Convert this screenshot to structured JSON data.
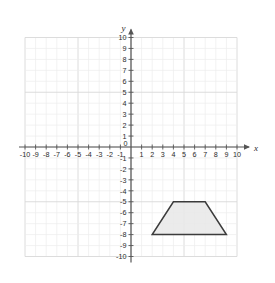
{
  "chart_data": {
    "type": "scatter",
    "title": "",
    "xlabel": "x",
    "ylabel": "y",
    "xlim": [
      -10,
      10
    ],
    "ylim": [
      -10,
      10
    ],
    "grid": true,
    "legend": false,
    "x_ticks": [
      "-10",
      "-9",
      "-8",
      "-7",
      "-6",
      "-5",
      "-4",
      "-3",
      "-2",
      "-1",
      "1",
      "2",
      "3",
      "4",
      "5",
      "6",
      "7",
      "8",
      "9",
      "10"
    ],
    "y_ticks": [
      "10",
      "9",
      "8",
      "7",
      "6",
      "5",
      "4",
      "3",
      "2",
      "1",
      "-1",
      "-2",
      "-3",
      "-4",
      "-5",
      "-6",
      "-7",
      "-8",
      "-9",
      "-10"
    ],
    "origin_label": "0",
    "shapes": [
      {
        "name": "trapezoid",
        "kind": "polygon",
        "vertices": [
          [
            2,
            -8
          ],
          [
            9,
            -8
          ],
          [
            7,
            -5
          ],
          [
            4,
            -5
          ]
        ],
        "fill": "#e8e8e8",
        "stroke": "#3b3b3b"
      }
    ]
  },
  "axes": {
    "x_axis_label": "x",
    "y_axis_label": "y",
    "origin": "0"
  },
  "colors": {
    "grid_minor": "#ededed",
    "grid_major": "#d8d8d8",
    "axis": "#555555",
    "shape_fill": "#e8e8e8",
    "shape_stroke": "#3b3b3b",
    "text": "#2b2b2b",
    "background": "#ffffff"
  }
}
